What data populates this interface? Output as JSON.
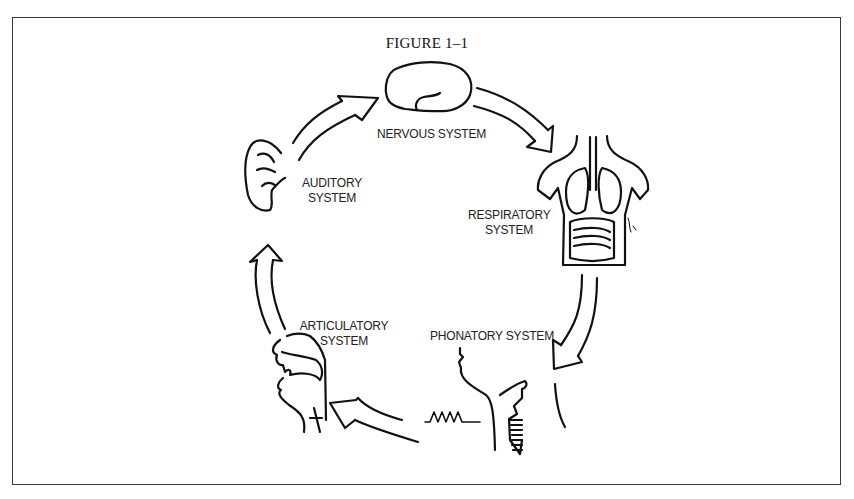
{
  "figure": {
    "title": "FIGURE 1–1"
  },
  "systems": {
    "nervous": {
      "label": "NERVOUS SYSTEM",
      "icon": "brain-icon"
    },
    "respiratory": {
      "label_line1": "RESPIRATORY",
      "label_line2": "SYSTEM",
      "icon": "torso-lungs-icon"
    },
    "phonatory": {
      "label": "PHONATORY SYSTEM",
      "icon": "larynx-icon"
    },
    "articulatory": {
      "label_line1": "ARTICULATORY",
      "label_line2": "SYSTEM",
      "icon": "vocal-tract-icon"
    },
    "auditory": {
      "label_line1": "AUDITORY",
      "label_line2": "SYSTEM",
      "icon": "ear-icon"
    }
  },
  "cycle_order": [
    "nervous",
    "respiratory",
    "phonatory",
    "articulatory",
    "auditory"
  ],
  "colors": {
    "line": "#111111",
    "frame": "#3a3a3a",
    "background": "#ffffff"
  }
}
